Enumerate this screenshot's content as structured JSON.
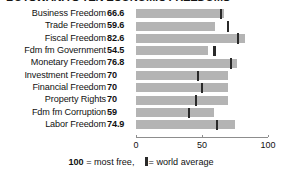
{
  "chart_data": {
    "type": "bar",
    "orientation": "horizontal",
    "title": "BOTSWANA'S TEN ECONOMIC FREEDOMS",
    "xlabel": "",
    "ylabel": "",
    "xlim": [
      0,
      100
    ],
    "xticks": [
      0,
      50,
      100
    ],
    "xtick_labels": [
      "0",
      "50",
      "100"
    ],
    "grid": false,
    "legend_position": "bottom",
    "categories": [
      "Business Freedom",
      "Trade Freedom",
      "Fiscal Freedom",
      "Fdm fm Government",
      "Monetary Freedom",
      "Investment Freedom",
      "Financial Freedom",
      "Property Rights",
      "Fdm fm Corruption",
      "Labor Freedom"
    ],
    "values": [
      66.6,
      59.6,
      82.6,
      54.5,
      76.8,
      70,
      70,
      70,
      59,
      74.9
    ],
    "value_labels": [
      "66.6",
      "59.6",
      "82.6",
      "54.5",
      "76.8",
      "70",
      "70",
      "70",
      "59",
      "74.9"
    ],
    "series": [
      {
        "name": "Botswana score",
        "values": [
          66.6,
          59.6,
          82.6,
          54.5,
          76.8,
          70,
          70,
          70,
          59,
          74.9
        ]
      },
      {
        "name": "world average",
        "marker": "vertical-line",
        "values": [
          64.5,
          69.5,
          77.5,
          59.5,
          72.0,
          47.0,
          50.0,
          45.5,
          40.0,
          61.5
        ]
      }
    ],
    "colors": {
      "bar": "#b4b4b4",
      "marker": "#2a2a2a",
      "axis": "#8d8d8d",
      "text": "#111111",
      "background": "#ffffff"
    }
  },
  "legend": {
    "max_value": "100",
    "max_text": "= most free,",
    "marker_text": "= world average"
  }
}
